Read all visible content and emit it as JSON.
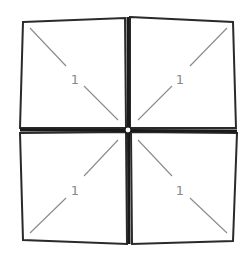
{
  "diagram": {
    "squares": [
      {
        "id": "top-left",
        "label": "1",
        "points": "23,22 125,18 126,128 20,128",
        "diagonal": {
          "x1": 30,
          "y1": 28,
          "x2": 118,
          "y2": 120
        },
        "diagonal_gap": {
          "x1": 66,
          "y1": 66,
          "x2": 84,
          "y2": 86
        },
        "label_pos": {
          "x": 75,
          "y": 80
        }
      },
      {
        "id": "top-right",
        "label": "1",
        "points": "130,17 233,22 236,128 130,128",
        "diagonal": {
          "x1": 227,
          "y1": 28,
          "x2": 138,
          "y2": 120
        },
        "diagonal_gap": {
          "x1": 190,
          "y1": 66,
          "x2": 172,
          "y2": 86
        },
        "label_pos": {
          "x": 180,
          "y": 80
        }
      },
      {
        "id": "bottom-left",
        "label": "1",
        "points": "20,133 126,132 127,244 23,240",
        "diagonal": {
          "x1": 118,
          "y1": 140,
          "x2": 30,
          "y2": 233
        },
        "diagonal_gap": {
          "x1": 84,
          "y1": 176,
          "x2": 66,
          "y2": 198
        },
        "label_pos": {
          "x": 75,
          "y": 191
        }
      },
      {
        "id": "bottom-right",
        "label": "1",
        "points": "131,132 237,133 233,241 132,244",
        "diagonal": {
          "x1": 138,
          "y1": 140,
          "x2": 227,
          "y2": 233
        },
        "diagonal_gap": {
          "x1": 172,
          "y1": 176,
          "x2": 190,
          "y2": 198
        },
        "label_pos": {
          "x": 180,
          "y": 191
        }
      }
    ],
    "center": {
      "x": 128,
      "y": 130,
      "r": 3
    },
    "colors": {
      "outline": "#2a2a2a",
      "diagonal": "#8a8a8a",
      "label": "#8a8a8a",
      "background": "#ffffff"
    }
  }
}
